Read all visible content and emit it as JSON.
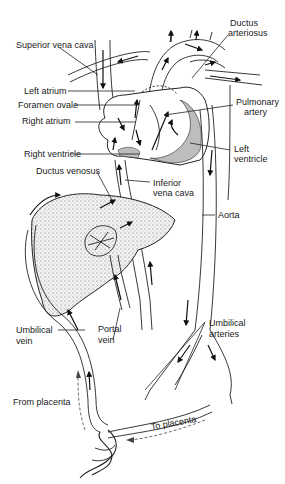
{
  "figure": {
    "background": "#ffffff",
    "ink_color": "#1a1a1a",
    "liver_fill": "#e6e6e6",
    "heart_wall_fill": "#bdbdbd"
  },
  "labels": {
    "superior_vena_cava": "Superior vena cava",
    "ductus_arteriosus_1": "Ductus",
    "ductus_arteriosus_2": "arteriosus",
    "left_atrium": "Left atrium",
    "foramen_ovale": "Foramen ovale",
    "right_atrium": "Right atrium",
    "pulmonary_artery_1": "Pulmonary",
    "pulmonary_artery_2": "artery",
    "right_ventricle": "Right ventricle",
    "left_ventricle_1": "Left",
    "left_ventricle_2": "ventricle",
    "ductus_venosus": "Ductus venosus",
    "inferior_vena_cava_1": "Inferior",
    "inferior_vena_cava_2": "vena cava",
    "aorta": "Aorta",
    "umbilical_vein_1": "Umbilical",
    "umbilical_vein_2": "vein",
    "portal_vein_1": "Portal",
    "portal_vein_2": "vein",
    "umbilical_arteries_1": "Umbilical",
    "umbilical_arteries_2": "arteries",
    "from_placenta": "From placenta",
    "to_placenta": "To placenta"
  },
  "icons": {
    "flow_arrow": "flow-arrow-icon"
  }
}
